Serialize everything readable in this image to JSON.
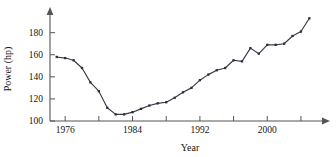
{
  "chart_data": {
    "type": "line",
    "title": "",
    "xlabel": "Year",
    "ylabel": "Power (hp)",
    "xlim": [
      1974.2,
      2006.5
    ],
    "ylim": [
      100,
      196
    ],
    "grid": false,
    "legend": "none",
    "xticks": [
      1976,
      1980,
      1984,
      1988,
      1992,
      1996,
      2000,
      2004
    ],
    "xtick_labels": [
      "1976",
      "",
      "1984",
      "",
      "1992",
      "",
      "2000",
      ""
    ],
    "yticks": [
      100,
      120,
      140,
      160,
      180
    ],
    "ytick_labels": [
      "100",
      "120",
      "140",
      "160",
      "180"
    ],
    "marker": "filled-square",
    "line_color": "#3a3a4a",
    "marker_color": "#2e2e3c",
    "axis_color": "#555555",
    "x": [
      1975,
      1976,
      1977,
      1978,
      1979,
      1980,
      1981,
      1982,
      1983,
      1984,
      1985,
      1986,
      1987,
      1988,
      1989,
      1990,
      1991,
      1992,
      1993,
      1994,
      1995,
      1996,
      1997,
      1998,
      1999,
      2000,
      2001,
      2002,
      2003,
      2004,
      2005
    ],
    "values": [
      158,
      157,
      155,
      148,
      135,
      127,
      112,
      106,
      106,
      108,
      111,
      114,
      116,
      117,
      121,
      126,
      130,
      137,
      142,
      146,
      148,
      155,
      154,
      166,
      161,
      169,
      169,
      170,
      177,
      181,
      193
    ],
    "series": [
      {
        "name": "Power",
        "values": [
          158,
          157,
          155,
          148,
          135,
          127,
          112,
          106,
          106,
          108,
          111,
          114,
          116,
          117,
          121,
          126,
          130,
          137,
          142,
          146,
          148,
          155,
          154,
          166,
          161,
          169,
          169,
          170,
          177,
          181,
          193
        ]
      }
    ]
  }
}
